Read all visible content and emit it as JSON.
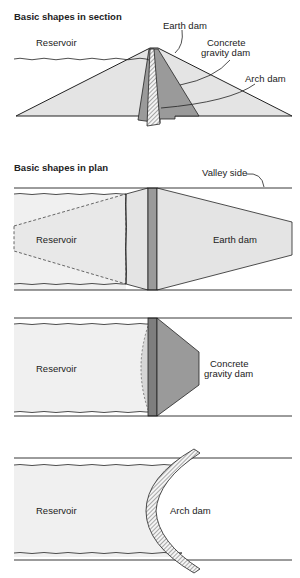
{
  "section": {
    "title": "Basic shapes in section",
    "labels": {
      "reservoir": "Reservoir",
      "earth_dam": "Earth dam",
      "concrete_line1": "Concrete",
      "concrete_line2": "gravity dam",
      "arch_dam": "Arch dam"
    }
  },
  "plan": {
    "title": "Basic shapes in plan",
    "valley_side": "Valley side",
    "earth": {
      "reservoir": "Reservoir",
      "dam": "Earth dam"
    },
    "concrete": {
      "reservoir": "Reservoir",
      "dam_line1": "Concrete",
      "dam_line2": "gravity dam"
    },
    "arch": {
      "reservoir": "Reservoir",
      "dam": "Arch dam"
    }
  },
  "colors": {
    "earth_fill": "#e4e4e4",
    "concrete_fill": "#9a9a9a",
    "reservoir_fill": "#f0f0f0",
    "line": "#222222"
  }
}
